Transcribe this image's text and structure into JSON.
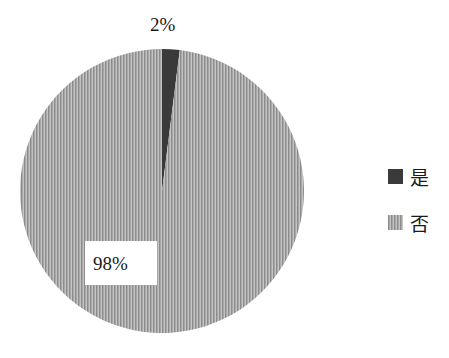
{
  "chart_data": {
    "type": "pie",
    "title": "",
    "categories": [
      "是",
      "否"
    ],
    "values": [
      2,
      98
    ],
    "labels": [
      "2%",
      "98%"
    ],
    "legend": {
      "position": "right",
      "entries": [
        "是",
        "否"
      ]
    },
    "colors": {
      "是": "#3a3a3a",
      "否": "#a8a8a8"
    }
  },
  "labels": {
    "slice_yes": "2%",
    "slice_no": "98%"
  },
  "legend": {
    "yes": "是",
    "no": "否"
  }
}
